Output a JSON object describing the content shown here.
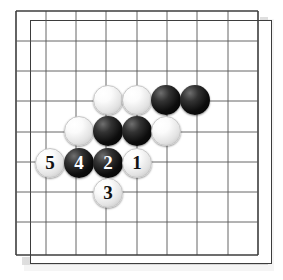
{
  "figure": {
    "kind": "go-board-diagram",
    "board": {
      "columns": 9,
      "rows": 9,
      "line_color": "#555555",
      "border_color": "#3d3d3d",
      "background_color": "#ffffff",
      "origin_x": 16,
      "origin_y": 11,
      "cell_size": 30.25,
      "grid_lines_x": [
        16,
        46,
        76,
        106,
        137,
        167,
        197,
        228,
        258
      ],
      "grid_lines_y": [
        11,
        41,
        71,
        101,
        132,
        162,
        192,
        222,
        255
      ]
    },
    "colors": {
      "black_stone": "#000000",
      "white_stone": "#ffffff",
      "black_label": "#ffffff",
      "white_label": "#111111",
      "shadow": "#dcdcdc"
    },
    "stones": [
      {
        "id": "w-a",
        "color": "white",
        "label": "",
        "x": 108,
        "y": 100
      },
      {
        "id": "w-b",
        "color": "white",
        "label": "",
        "x": 137,
        "y": 100
      },
      {
        "id": "b-a",
        "color": "black",
        "label": "",
        "x": 166,
        "y": 100
      },
      {
        "id": "b-b",
        "color": "black",
        "label": "",
        "x": 195,
        "y": 100
      },
      {
        "id": "w-c",
        "color": "white",
        "label": "",
        "x": 79,
        "y": 131
      },
      {
        "id": "b-c",
        "color": "black",
        "label": "",
        "x": 108,
        "y": 131
      },
      {
        "id": "b-d",
        "color": "black",
        "label": "",
        "x": 137,
        "y": 131
      },
      {
        "id": "w-d",
        "color": "white",
        "label": "",
        "x": 166,
        "y": 131
      },
      {
        "id": "move-5",
        "color": "white",
        "label": "5",
        "x": 50,
        "y": 163
      },
      {
        "id": "move-4",
        "color": "black",
        "label": "4",
        "x": 79,
        "y": 163
      },
      {
        "id": "move-2",
        "color": "black",
        "label": "2",
        "x": 108,
        "y": 163
      },
      {
        "id": "move-1",
        "color": "white",
        "label": "1",
        "x": 137,
        "y": 163
      },
      {
        "id": "move-3",
        "color": "white",
        "label": "3",
        "x": 108,
        "y": 193
      }
    ],
    "move_sequence": [
      {
        "move": "1",
        "color": "white"
      },
      {
        "move": "2",
        "color": "black"
      },
      {
        "move": "3",
        "color": "white"
      },
      {
        "move": "4",
        "color": "black"
      },
      {
        "move": "5",
        "color": "white"
      }
    ]
  }
}
